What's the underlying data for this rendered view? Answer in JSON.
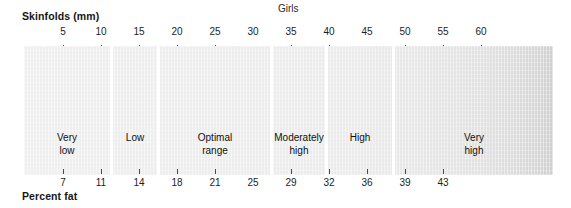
{
  "chart_data": {
    "type": "bar",
    "title": "Girls",
    "orientation": "horizontal-band",
    "xlabel": "Skinfolds (mm)",
    "ylabel": "Percent fat",
    "grid": false,
    "legend": "none",
    "axes": [
      {
        "name": "skinfolds-mm",
        "position": "top",
        "label": "Skinfolds (mm)",
        "unit": "mm",
        "ticks": [
          5,
          10,
          15,
          20,
          25,
          30,
          35,
          40,
          45,
          50,
          55,
          60
        ],
        "tick_labels": [
          "5",
          "10",
          "15",
          "20",
          "25",
          "30",
          "35",
          "40",
          "45",
          "50",
          "55",
          "60"
        ],
        "tick_x": [
          63,
          101,
          139,
          177,
          215,
          253,
          291,
          329,
          367,
          405,
          443,
          481
        ],
        "tick_mark_visible": [
          true,
          true,
          true,
          true,
          true,
          false,
          true,
          true,
          false,
          true,
          true,
          true
        ],
        "range": [
          0,
          70
        ]
      },
      {
        "name": "percent-fat",
        "position": "bottom",
        "label": "Percent fat",
        "unit": "%",
        "ticks": [
          7,
          11,
          14,
          18,
          21,
          25,
          29,
          32,
          36,
          39,
          43
        ],
        "tick_labels": [
          "7",
          "11",
          "14",
          "18",
          "21",
          "25",
          "29",
          "32",
          "36",
          "39",
          "43"
        ],
        "tick_x": [
          63,
          101,
          139,
          177,
          215,
          253,
          291,
          329,
          367,
          405,
          443
        ],
        "tick_mark_visible": [
          true,
          true,
          true,
          true,
          true,
          false,
          true,
          true,
          true,
          true,
          true
        ],
        "range": [
          0,
          50
        ]
      }
    ],
    "categories": [
      "Very low",
      "Low",
      "Optimal range",
      "Moderately high",
      "High",
      "Very high"
    ],
    "zones": [
      {
        "label": "Very\nlow",
        "label_plain": "Very low",
        "start_x": 24,
        "end_x": 110,
        "center_x": 67,
        "skinfolds_mm": [
          0,
          11
        ],
        "percent_fat": [
          0,
          12
        ]
      },
      {
        "label": "Low",
        "label_plain": "Low",
        "start_x": 113,
        "end_x": 157,
        "center_x": 135,
        "skinfolds_mm": [
          11,
          17
        ],
        "percent_fat": [
          12,
          16
        ]
      },
      {
        "label": "Optimal\nrange",
        "label_plain": "Optimal range",
        "start_x": 160,
        "end_x": 270,
        "center_x": 215,
        "skinfolds_mm": [
          17,
          32
        ],
        "percent_fat": [
          16,
          26
        ]
      },
      {
        "label": "Moderately\nhigh",
        "label_plain": "Moderately high",
        "start_x": 273,
        "end_x": 325,
        "center_x": 299,
        "skinfolds_mm": [
          32,
          39
        ],
        "percent_fat": [
          26,
          30
        ]
      },
      {
        "label": "High",
        "label_plain": "High",
        "start_x": 328,
        "end_x": 392,
        "center_x": 360,
        "skinfolds_mm": [
          39,
          48
        ],
        "percent_fat": [
          30,
          34
        ]
      },
      {
        "label": "Very\nhigh",
        "label_plain": "Very high",
        "start_x": 395,
        "end_x": 553,
        "center_x": 474,
        "skinfolds_mm": [
          48,
          70
        ],
        "percent_fat": [
          34,
          50
        ]
      }
    ],
    "dividers_x": [
      110,
      157,
      270,
      325,
      392
    ],
    "band": {
      "left": 24,
      "top": 46,
      "width": 529,
      "height": 129
    },
    "colors": {
      "band_fill_light": "#efefef",
      "band_fill_dark": "#cfcfcf",
      "divider": "#ffffff",
      "text": "#111111",
      "tick": "#4a4a4a",
      "background": "#ffffff"
    }
  }
}
